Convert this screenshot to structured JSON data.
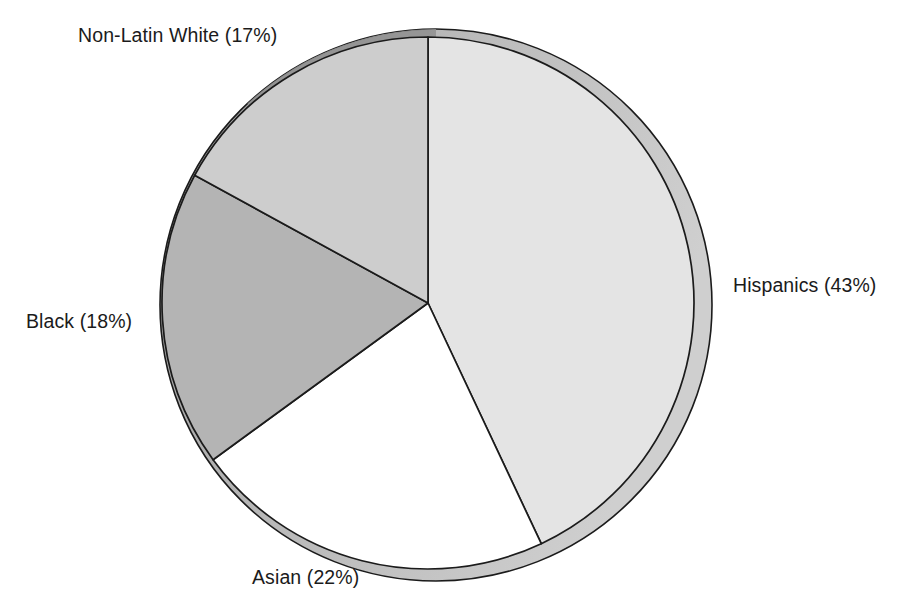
{
  "figure": {
    "width": 907,
    "height": 612,
    "background": "#ffffff"
  },
  "chart_data": {
    "type": "pie",
    "title": "",
    "subtitle": "",
    "xlabel": "",
    "ylabel": "",
    "grid": false,
    "legend_position": "none",
    "label_style": "outside-callout-text",
    "units": "percent",
    "total": 100,
    "categories": [
      "Hispanics",
      "Asian",
      "Black",
      "Non-Latin White"
    ],
    "values": [
      43,
      22,
      18,
      17
    ],
    "labels": [
      "Hispanics (43%)",
      "Asian (22%)",
      "Black (18%)",
      "Non-Latin White (17%)"
    ],
    "slices": [
      {
        "name": "Hispanics",
        "value": 43,
        "label": "Hispanics (43%)",
        "percent_text": "43%",
        "fill": "#e4e4e4",
        "stroke": "#1b1b1b",
        "start_angle_deg": 0,
        "end_angle_deg": 154.8
      },
      {
        "name": "Asian",
        "value": 22,
        "label": "Asian (22%)",
        "percent_text": "22%",
        "fill": "#ffffff",
        "stroke": "#1b1b1b",
        "start_angle_deg": 154.8,
        "end_angle_deg": 233.9
      },
      {
        "name": "Black",
        "value": 18,
        "label": "Black (18%)",
        "percent_text": "18%",
        "fill": "#b4b4b4",
        "stroke": "#1b1b1b",
        "start_angle_deg": 233.9,
        "end_angle_deg": 298.7
      },
      {
        "name": "Non-Latin White",
        "value": 17,
        "label": "Non-Latin White (17%)",
        "percent_text": "17%",
        "fill": "#cdcdcd",
        "stroke": "#1b1b1b",
        "start_angle_deg": 298.7,
        "end_angle_deg": 360
      }
    ],
    "colors": {
      "hispanics": "#e4e4e4",
      "asian": "#ffffff",
      "black": "#b4b4b4",
      "non_latin_white": "#cdcdcd",
      "backing_disc": "#c6c6c6",
      "backing_disc_shade": "#9b9b9b",
      "outline": "#1b1b1b",
      "text": "#1b1b1b"
    },
    "geometry": {
      "backing_center_x": 436,
      "backing_center_y": 305,
      "backing_radius": 276,
      "pie_center_x": 428,
      "pie_center_y": 303,
      "pie_radius": 266
    }
  },
  "labels": {
    "non_latin_white": "Non-Latin White (17%)",
    "hispanics": "Hispanics (43%)",
    "black": "Black (18%)",
    "asian": "Asian (22%)"
  }
}
